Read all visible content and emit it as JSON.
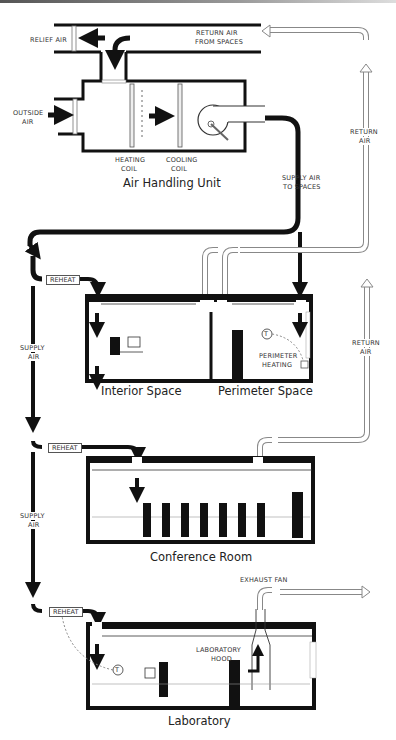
{
  "diagram": {
    "type": "HVAC variable air volume system schematic",
    "air_handling_unit": {
      "title": "Air Handling Unit",
      "labels": {
        "relief_air": "RELIEF AIR",
        "return_air_from_spaces_line1": "RETURN AIR",
        "return_air_from_spaces_line2": "FROM SPACES",
        "outside_air_line1": "OUTSIDE",
        "outside_air_line2": "AIR",
        "heating_coil_line1": "HEATING",
        "heating_coil_line2": "COIL",
        "cooling_coil_line1": "COOLING",
        "cooling_coil_line2": "COIL",
        "supply_air_to_spaces_line1": "SUPPLY AIR",
        "supply_air_to_spaces_line2": "TO SPACES"
      }
    },
    "supply_labels": [
      {
        "line1": "SUPPLY",
        "line2": "AIR"
      },
      {
        "line1": "SUPPLY",
        "line2": "AIR"
      }
    ],
    "return_labels": [
      {
        "line1": "RETURN",
        "line2": "AIR"
      },
      {
        "line1": "RETURN",
        "line2": "AIR"
      }
    ],
    "reheat_label": "REHEAT",
    "spaces": [
      {
        "title": "Interior Space"
      },
      {
        "title": "Perimeter Space",
        "labels": {
          "thermostat": "T",
          "perimeter_heating_line1": "PERIMETER",
          "perimeter_heating_line2": "HEATING"
        }
      },
      {
        "title": "Conference Room"
      },
      {
        "title": "Laboratory",
        "labels": {
          "thermostat": "T",
          "hood_line1": "LABORATORY",
          "hood_line2": "HOOD",
          "exhaust_fan": "EXHAUST FAN"
        }
      }
    ],
    "colors": {
      "supply_duct": "#111111",
      "return_duct": "#ffffff",
      "return_outline": "#888888",
      "wall": "#111111"
    }
  }
}
